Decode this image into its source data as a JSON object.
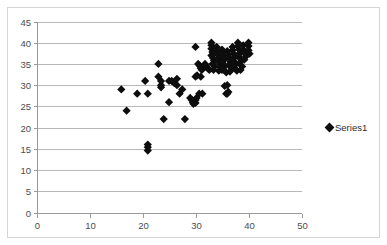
{
  "chart_data": {
    "type": "scatter",
    "title": "",
    "xlabel": "",
    "ylabel": "",
    "xlim": [
      0,
      50
    ],
    "ylim": [
      0,
      45
    ],
    "xticks": [
      0,
      10,
      20,
      30,
      40,
      50
    ],
    "yticks": [
      0,
      5,
      10,
      15,
      20,
      25,
      30,
      35,
      40,
      45
    ],
    "grid": "horizontal",
    "legend_position": "right",
    "marker": "diamond",
    "marker_color": "#0d0d0d",
    "series": [
      {
        "name": "Series1",
        "points": [
          [
            16,
            29
          ],
          [
            17,
            24
          ],
          [
            19,
            28
          ],
          [
            20.5,
            31
          ],
          [
            21,
            28
          ],
          [
            21,
            16
          ],
          [
            21,
            15.4
          ],
          [
            21,
            14.6
          ],
          [
            23,
            35
          ],
          [
            23,
            32
          ],
          [
            23.5,
            31
          ],
          [
            23.5,
            30
          ],
          [
            23.5,
            29.5
          ],
          [
            24,
            22
          ],
          [
            25,
            26
          ],
          [
            25,
            31
          ],
          [
            25.5,
            31
          ],
          [
            26,
            30.5
          ],
          [
            26.5,
            31.5
          ],
          [
            26.5,
            30
          ],
          [
            27,
            28
          ],
          [
            27.5,
            29
          ],
          [
            28,
            22
          ],
          [
            29,
            27
          ],
          [
            29.3,
            26.5
          ],
          [
            29.5,
            26
          ],
          [
            29.8,
            26.2
          ],
          [
            30,
            26.5
          ],
          [
            30.2,
            27
          ],
          [
            30,
            25.8
          ],
          [
            29.6,
            25.6
          ],
          [
            30,
            39
          ],
          [
            30,
            32
          ],
          [
            30.3,
            32.3
          ],
          [
            30.5,
            35
          ],
          [
            30.8,
            34.6
          ],
          [
            31,
            34
          ],
          [
            31.2,
            33.6
          ],
          [
            31.5,
            34.2
          ],
          [
            31,
            32
          ],
          [
            31.3,
            28
          ],
          [
            30.7,
            28
          ],
          [
            31.8,
            35
          ],
          [
            32,
            34.5
          ],
          [
            32.3,
            34
          ],
          [
            32.6,
            33.6
          ],
          [
            33,
            40
          ],
          [
            33,
            39.4
          ],
          [
            33,
            38.6
          ],
          [
            33.2,
            37.8
          ],
          [
            33,
            37
          ],
          [
            33.3,
            36.4
          ],
          [
            33.5,
            35.8
          ],
          [
            33.2,
            35
          ],
          [
            33.6,
            34.4
          ],
          [
            33.4,
            33.6
          ],
          [
            34,
            39
          ],
          [
            34,
            38
          ],
          [
            34.2,
            37.2
          ],
          [
            34.5,
            36.4
          ],
          [
            34.3,
            35.6
          ],
          [
            34.6,
            35
          ],
          [
            34.8,
            34.2
          ],
          [
            34.4,
            33.4
          ],
          [
            35,
            38.4
          ],
          [
            35,
            37.6
          ],
          [
            35.2,
            36.8
          ],
          [
            35.4,
            36
          ],
          [
            35.1,
            35.2
          ],
          [
            35.5,
            34.4
          ],
          [
            35,
            33.6
          ],
          [
            35.8,
            33
          ],
          [
            35.5,
            29.8
          ],
          [
            35.8,
            28
          ],
          [
            36,
            28
          ],
          [
            36.2,
            28.4
          ],
          [
            36,
            30
          ],
          [
            36,
            38
          ],
          [
            36.2,
            37.2
          ],
          [
            36.4,
            36.4
          ],
          [
            36.6,
            35.6
          ],
          [
            36.3,
            34.8
          ],
          [
            36.8,
            34
          ],
          [
            36.5,
            33.2
          ],
          [
            37,
            39
          ],
          [
            37,
            38.2
          ],
          [
            37.2,
            37.4
          ],
          [
            37.4,
            36.6
          ],
          [
            37.1,
            35.8
          ],
          [
            37.6,
            35
          ],
          [
            37.3,
            34.2
          ],
          [
            37.8,
            33.4
          ],
          [
            38,
            40
          ],
          [
            38,
            39.2
          ],
          [
            38.2,
            38.4
          ],
          [
            38.4,
            37.6
          ],
          [
            38.1,
            36.8
          ],
          [
            38.6,
            36
          ],
          [
            38.3,
            35.2
          ],
          [
            38.8,
            34.4
          ],
          [
            38.5,
            33.6
          ],
          [
            39,
            39.4
          ],
          [
            39,
            38.4
          ],
          [
            39.3,
            37.6
          ],
          [
            39.5,
            36.8
          ],
          [
            39.2,
            36
          ],
          [
            39.7,
            37.2
          ],
          [
            40,
            40
          ],
          [
            40,
            39.2
          ],
          [
            40,
            38.2
          ],
          [
            40.2,
            37.4
          ]
        ]
      }
    ]
  },
  "legend": {
    "entries": [
      {
        "label": "Series1"
      }
    ]
  },
  "axes": {
    "x_tick_labels": [
      "0",
      "10",
      "20",
      "30",
      "40",
      "50"
    ],
    "y_tick_labels": [
      "0",
      "5",
      "10",
      "15",
      "20",
      "25",
      "30",
      "35",
      "40",
      "45"
    ]
  },
  "ghost_header": ""
}
